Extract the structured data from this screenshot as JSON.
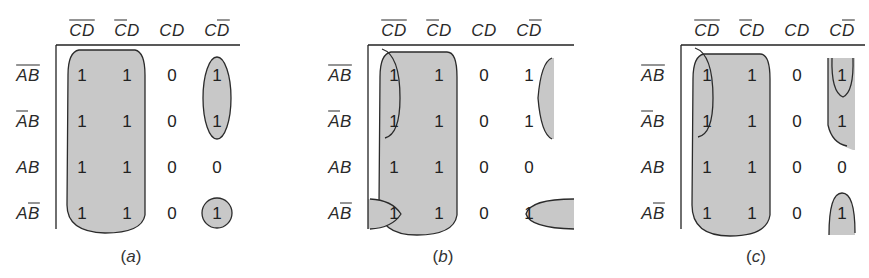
{
  "figure": {
    "column_headers": [
      {
        "parts": [
          {
            "t": "C",
            "bar": true
          },
          {
            "t": "D",
            "bar": true
          }
        ],
        "text": "C̄D̄"
      },
      {
        "parts": [
          {
            "t": "C",
            "bar": true
          },
          {
            "t": "D",
            "bar": false
          }
        ],
        "text": "C̄D"
      },
      {
        "parts": [
          {
            "t": "C",
            "bar": false
          },
          {
            "t": "D",
            "bar": false
          }
        ],
        "text": "CD"
      },
      {
        "parts": [
          {
            "t": "C",
            "bar": false
          },
          {
            "t": "D",
            "bar": true
          }
        ],
        "text": "CD̄"
      }
    ],
    "row_headers": [
      {
        "parts": [
          {
            "t": "A",
            "bar": true
          },
          {
            "t": "B",
            "bar": true
          }
        ],
        "text": "ĀB̄"
      },
      {
        "parts": [
          {
            "t": "A",
            "bar": true
          },
          {
            "t": "B",
            "bar": false
          }
        ],
        "text": "ĀB"
      },
      {
        "parts": [
          {
            "t": "A",
            "bar": false
          },
          {
            "t": "B",
            "bar": false
          }
        ],
        "text": "AB"
      },
      {
        "parts": [
          {
            "t": "A",
            "bar": false
          },
          {
            "t": "B",
            "bar": true
          }
        ],
        "text": "AB̄"
      }
    ],
    "cells": [
      [
        "1",
        "1",
        "0",
        "1"
      ],
      [
        "1",
        "1",
        "0",
        "1"
      ],
      [
        "1",
        "1",
        "0",
        "0"
      ],
      [
        "1",
        "1",
        "0",
        "1"
      ]
    ],
    "colors": {
      "shade": "#c8c8c8",
      "stroke": "#2b2b2b",
      "text": "#222222"
    }
  },
  "panels": [
    {
      "id": "a",
      "caption_open": "(",
      "caption_letter": "a",
      "caption_close": ")",
      "groupings": [
        {
          "name": "columns-CbarDbar-CbarD-all-rows",
          "shape": "rounded-rect"
        },
        {
          "name": "CDbar-rows-AbarBbar-AbarB",
          "shape": "ellipse"
        },
        {
          "name": "CDbar-row-ABbar",
          "shape": "circle"
        }
      ]
    },
    {
      "id": "b",
      "caption_open": "(",
      "caption_letter": "b",
      "caption_close": ")",
      "groupings": [
        {
          "name": "columns-CbarDbar-CbarD-all-rows",
          "shape": "rounded-rect"
        },
        {
          "name": "wrap-CbarDbar-CDbar-rows-AbarBbar-AbarB",
          "shape": "split-ellipse"
        },
        {
          "name": "wrap-CbarDbar-CDbar-row-ABbar",
          "shape": "split-ellipse"
        }
      ]
    },
    {
      "id": "c",
      "caption_open": "(",
      "caption_letter": "c",
      "caption_close": ")",
      "groupings": [
        {
          "name": "columns-CbarDbar-CbarD-all-rows",
          "shape": "rounded-rect"
        },
        {
          "name": "wrap-CbarDbar-CDbar-rows-AbarBbar-AbarB",
          "shape": "split-ellipse"
        },
        {
          "name": "wrap-CDbar-rows-AbarBbar-ABbar",
          "shape": "split-arch"
        }
      ]
    }
  ]
}
